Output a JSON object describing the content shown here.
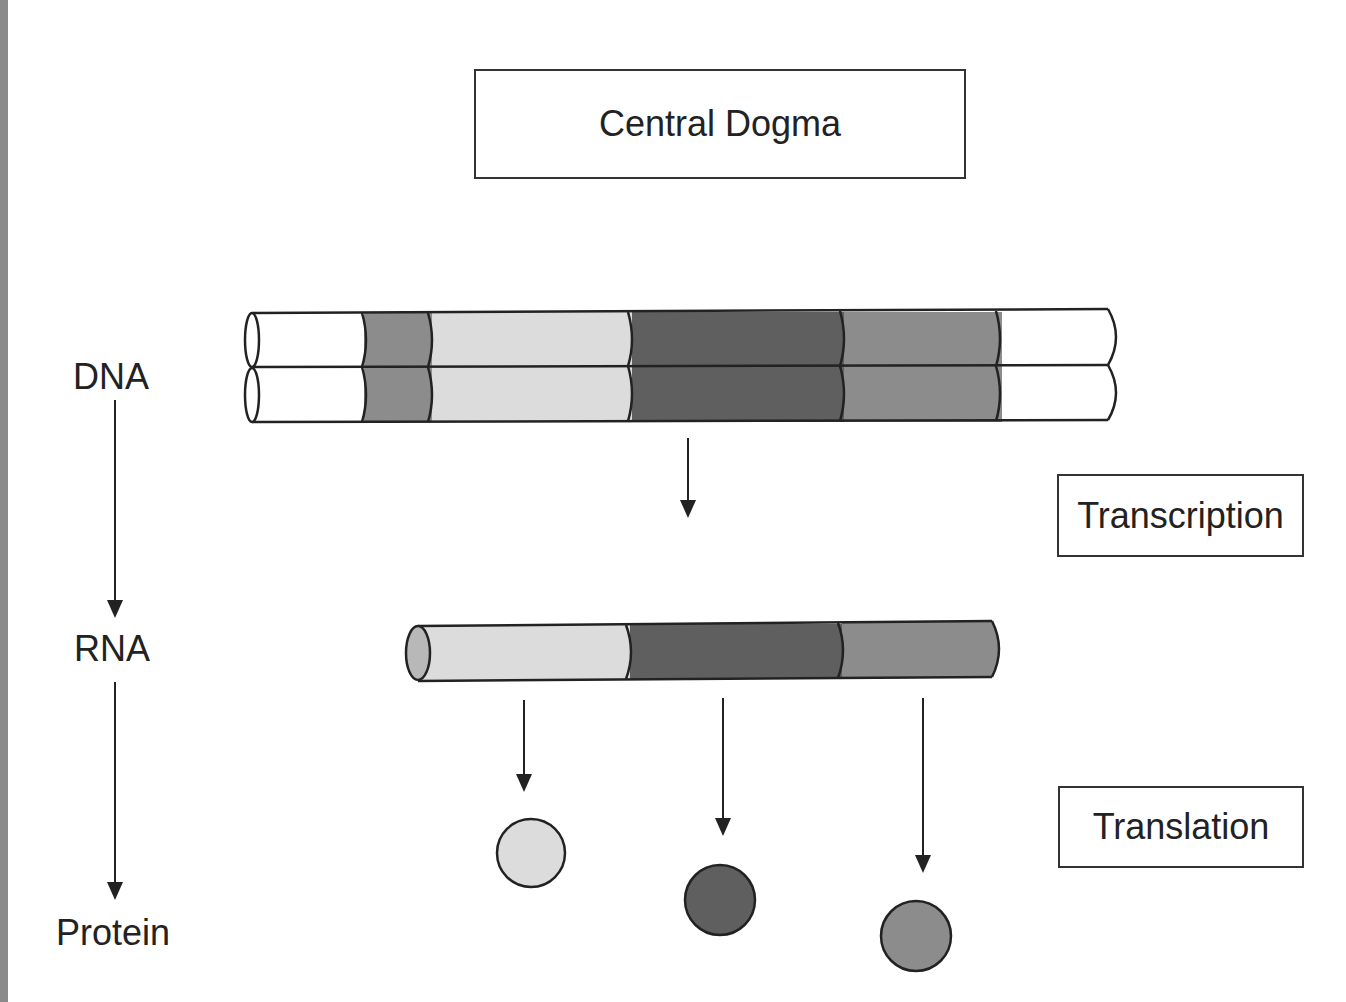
{
  "title": "Central Dogma",
  "stages": {
    "dna": "DNA",
    "rna": "RNA",
    "protein": "Protein"
  },
  "processes": {
    "transcription": "Transcription",
    "translation": "Translation"
  },
  "colors": {
    "white": "#ffffff",
    "light_gray": "#dcdcdc",
    "medium_gray": "#8c8c8c",
    "dark_gray": "#5f5f5f",
    "outline": "#222222"
  },
  "dna_segments": [
    "white",
    "medium_gray",
    "light_gray",
    "dark_gray",
    "medium_gray",
    "white"
  ],
  "rna_segments": [
    "light_gray",
    "dark_gray",
    "medium_gray"
  ],
  "proteins": [
    "light_gray",
    "dark_gray",
    "medium_gray"
  ]
}
